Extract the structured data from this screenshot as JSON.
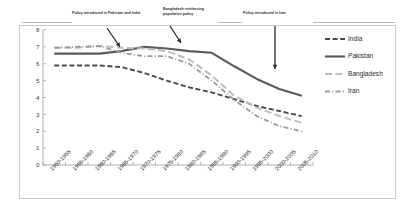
{
  "chart_data": {
    "type": "line",
    "title": "",
    "xlabel": "",
    "ylabel": "",
    "ylim": [
      0,
      8
    ],
    "ytick_step": 1,
    "grid": false,
    "legend_position": "right",
    "categories": [
      "1950-1955",
      "1955-1960",
      "1960-1965",
      "1965-1970",
      "1970-1975",
      "1975-1980",
      "1980-1985",
      "1985-1990",
      "1990-1995",
      "1995-2000",
      "2000-2005",
      "2005-2010"
    ],
    "ytick_labels": [
      "0",
      "1",
      "2",
      "3",
      "4",
      "5",
      "6",
      "7",
      "8"
    ],
    "series": [
      {
        "name": "India",
        "color": "#4a4a4a",
        "dash": "5,2.6",
        "width": 1.9,
        "values": [
          5.9,
          5.9,
          5.9,
          5.8,
          5.45,
          5.0,
          4.6,
          4.3,
          3.9,
          3.5,
          3.2,
          2.9
        ]
      },
      {
        "name": "Pakistan",
        "color": "#5a5a5a",
        "dash": "none",
        "width": 2.1,
        "values": [
          6.6,
          6.6,
          6.6,
          6.75,
          7.0,
          6.9,
          6.75,
          6.65,
          5.85,
          5.1,
          4.5,
          4.1
        ]
      },
      {
        "name": "Bangladesh",
        "color": "#bdbdbd",
        "dash": "7,3.4",
        "width": 2.0,
        "values": [
          6.95,
          6.95,
          7.05,
          6.95,
          6.9,
          6.75,
          6.25,
          5.3,
          4.1,
          3.4,
          2.9,
          2.5
        ]
      },
      {
        "name": "Iran",
        "color": "#9a9a9a",
        "dash": "5,2.2,1.1,2.2",
        "width": 1.8,
        "values": [
          6.95,
          7.0,
          7.05,
          6.65,
          6.45,
          6.45,
          6.0,
          5.0,
          3.85,
          2.9,
          2.3,
          2.0
        ]
      }
    ],
    "annotations": [
      {
        "text": "Policy introduced in Pakistan and India",
        "arrow": "diagonal"
      },
      {
        "text": "Bangladesh reinforcing population policy",
        "arrow": "diagonal"
      },
      {
        "text": "Policy introduced in Iran",
        "arrow": "vertical"
      }
    ]
  }
}
